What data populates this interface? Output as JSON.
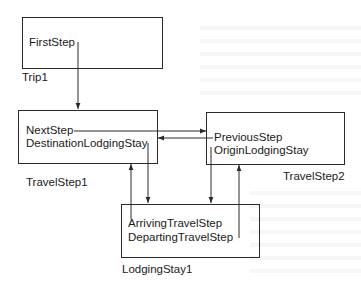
{
  "diagram": {
    "type": "object-reference-diagram",
    "nodes": [
      {
        "id": "trip1",
        "label": "Trip1",
        "fields": [
          "FirstStep"
        ]
      },
      {
        "id": "travelstep1",
        "label": "TravelStep1",
        "fields": [
          "NextStep",
          "DestinationLodgingStay"
        ]
      },
      {
        "id": "travelstep2",
        "label": "TravelStep2",
        "fields": [
          "PreviousStep",
          "OriginLodgingStay"
        ]
      },
      {
        "id": "lodgingstay1",
        "label": "LodgingStay1",
        "fields": [
          "ArrivingTravelStep",
          "DepartingTravelStep"
        ]
      }
    ],
    "edges": [
      {
        "from": "trip1.FirstStep",
        "to": "travelstep1"
      },
      {
        "from": "travelstep1.NextStep",
        "to": "travelstep2"
      },
      {
        "from": "travelstep2.PreviousStep",
        "to": "travelstep1"
      },
      {
        "from": "travelstep1.DestinationLodgingStay",
        "to": "lodgingstay1"
      },
      {
        "from": "travelstep2.OriginLodgingStay",
        "to": "lodgingstay1"
      },
      {
        "from": "lodgingstay1.ArrivingTravelStep",
        "to": "travelstep1"
      },
      {
        "from": "lodgingstay1.DepartingTravelStep",
        "to": "travelstep2"
      }
    ],
    "colors": {
      "line": "#2a2a2a",
      "text": "#1a1a1a",
      "background": "#ffffff"
    }
  }
}
